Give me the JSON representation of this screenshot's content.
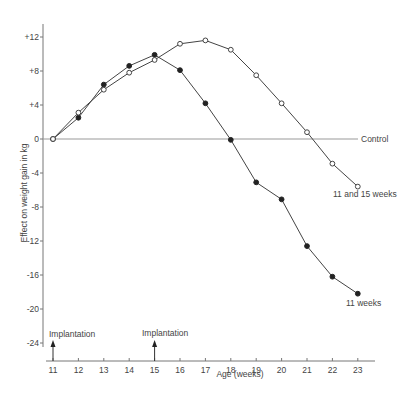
{
  "chart_data": {
    "type": "line",
    "title": "",
    "xlabel": "Age (weeks)",
    "ylabel": "Effect on weight gain in kg",
    "x": [
      11,
      12,
      13,
      14,
      15,
      16,
      17,
      18,
      19,
      20,
      21,
      22,
      23
    ],
    "xlim": [
      11,
      23
    ],
    "ylim": [
      -24,
      12
    ],
    "x_ticks": [
      "11",
      "12",
      "13",
      "14",
      "15",
      "16",
      "17",
      "18",
      "19",
      "20",
      "21",
      "22",
      "23"
    ],
    "y_ticks": [
      {
        "value": 12,
        "label": "+12"
      },
      {
        "value": 8,
        "label": "+8"
      },
      {
        "value": 4,
        "label": "+4"
      },
      {
        "value": 0,
        "label": "0"
      },
      {
        "value": -4,
        "label": "-4"
      },
      {
        "value": -8,
        "label": "-8"
      },
      {
        "value": -12,
        "label": "-12"
      },
      {
        "value": -16,
        "label": "-16"
      },
      {
        "value": -20,
        "label": "-20"
      },
      {
        "value": -24,
        "label": "-24"
      }
    ],
    "grid": false,
    "series": [
      {
        "name": "11 weeks",
        "marker": "filled-circle",
        "values": [
          0,
          2.5,
          6.4,
          8.6,
          9.9,
          8.1,
          4.2,
          -0.1,
          -5.1,
          -7.1,
          -12.6,
          -16.2,
          -18.2
        ]
      },
      {
        "name": "11 and 15 weeks",
        "marker": "open-circle",
        "values": [
          0,
          3.1,
          5.8,
          7.8,
          9.3,
          11.2,
          11.6,
          10.5,
          7.5,
          4.2,
          0.8,
          -2.9,
          -5.6
        ]
      }
    ],
    "reference_lines": [
      {
        "name": "Control",
        "y": 0
      }
    ],
    "annotations": [
      {
        "text": "Implantation",
        "x": 11,
        "type": "arrow-up"
      },
      {
        "text": "Implantation",
        "x": 15,
        "type": "arrow-up"
      },
      {
        "text": "Control",
        "position": "end-of-control-line"
      },
      {
        "text": "11 and 15 weeks",
        "position": "end-of-open-series"
      },
      {
        "text": "11 weeks",
        "position": "end-of-filled-series"
      }
    ],
    "legend": "inline labels at line ends"
  },
  "labels": {
    "xlabel": "Age (weeks)",
    "ylabel": "Effect on weight gain in kg",
    "control": "Control",
    "series_open": "11 and 15 weeks",
    "series_filled": "11 weeks",
    "implantation_1": "Implantation",
    "implantation_2": "Implantation"
  }
}
